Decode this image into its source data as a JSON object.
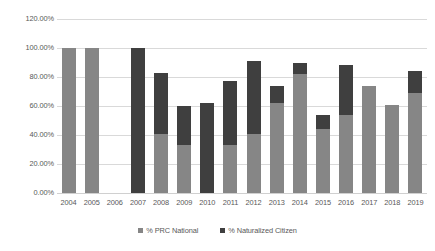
{
  "chart_data": {
    "type": "bar",
    "subtype": "stacked-column",
    "title": "",
    "xlabel": "",
    "ylabel": "",
    "ylim": [
      0,
      120
    ],
    "y_tick_labels": [
      "0.00%",
      "20.00%",
      "40.00%",
      "60.00%",
      "80.00%",
      "100.00%",
      "120.00%"
    ],
    "y_tick_values": [
      0,
      20,
      40,
      60,
      80,
      100,
      120
    ],
    "grid": true,
    "legend_position": "bottom",
    "categories": [
      "2004",
      "2005",
      "2006",
      "2007",
      "2008",
      "2009",
      "2010",
      "2011",
      "2012",
      "2013",
      "2014",
      "2015",
      "2016",
      "2017",
      "2018",
      "2019"
    ],
    "series": [
      {
        "name": "% PRC National",
        "color": "#868686",
        "values": [
          100,
          100,
          0,
          0,
          41,
          33,
          0,
          33,
          41,
          62,
          82,
          44,
          54,
          74,
          61,
          69
        ]
      },
      {
        "name": "% Naturalized Citizen",
        "color": "#3f3f3f",
        "values": [
          0,
          0,
          0,
          100,
          42,
          27,
          62,
          44,
          50,
          12,
          8,
          10,
          34,
          0,
          0,
          15
        ]
      }
    ],
    "totals": [
      100,
      100,
      0,
      100,
      83,
      60,
      62,
      77,
      91,
      74,
      90,
      54,
      88,
      74,
      61,
      84
    ]
  },
  "legend": {
    "items": [
      {
        "label": "% PRC National",
        "color": "#868686"
      },
      {
        "label": "% Naturalized Citizen",
        "color": "#3f3f3f"
      }
    ]
  },
  "colors": {
    "gridline": "#d9d9d9",
    "axis_text": "#595959",
    "background": "#ffffff",
    "series_prc_national": "#868686",
    "series_naturalized_citizen": "#3f3f3f"
  }
}
